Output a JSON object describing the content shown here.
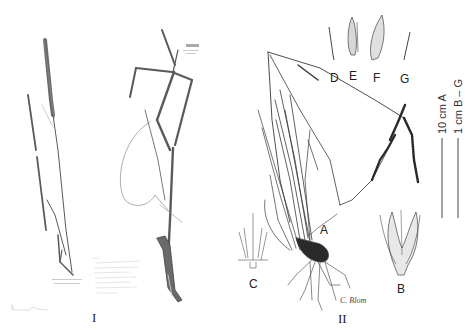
{
  "figure": {
    "panels": [
      {
        "id": "panel-I",
        "label": "I",
        "description": "herbarium specimen"
      },
      {
        "id": "panel-II",
        "label": "II",
        "description": "line drawing habit with dissections"
      }
    ],
    "part_labels": [
      "A",
      "B",
      "C",
      "D",
      "E",
      "F",
      "G"
    ],
    "scale_bars": [
      {
        "label": "10 cm A"
      },
      {
        "label": "1 cm B – G"
      }
    ],
    "herbarium_label": {
      "title": "Ischyleas/Bothriochloa",
      "lines": [
        "Specimen collection data",
        "Locality information",
        "Collector and date",
        "Determination",
        "Habitat notes",
        "Herbarium label"
      ]
    },
    "barcode_label": "barcode",
    "small_label": "determinavit",
    "illustrator_signature": "C. Blom",
    "colors": {
      "ink": "#3a3a3a",
      "specimen": "#555555",
      "paper": "#ffffff"
    }
  }
}
